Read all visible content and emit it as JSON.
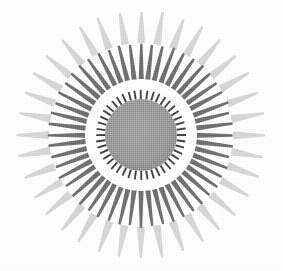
{
  "image": {
    "kind": "sunburst-emblem",
    "description": "Scanned halftone sunburst / starburst rosette",
    "width": 283,
    "height": 271,
    "background_color": "#ffffff"
  },
  "geometry": {
    "center_x": 141,
    "center_y": 135
  },
  "palette": {
    "background": "#ffffff",
    "center_disc": "#9a9a9a",
    "center_disc_edge": "#8d8d8d",
    "inner_tick": "#3f3f3f",
    "mid_ray": "#6e6e6e",
    "mid_ray_shade": "#5d5d5d",
    "outer_ray": "#d6d6d6",
    "outer_ray_shade": "#c4c4c4"
  },
  "layers": {
    "center_disc": {
      "name": "center-disc",
      "radius": 36,
      "fill": "#9a9a9a"
    },
    "inner_ticks": {
      "name": "inner-tick-ring",
      "count": 44,
      "inner_radius": 36,
      "outer_radius": 45,
      "base_width_deg": 3.1,
      "tip_width_deg": 2.3,
      "fill": "#3f3f3f"
    },
    "mid_rays": {
      "name": "mid-ray-ring",
      "count": 52,
      "inner_radius": 56,
      "outer_radius": 92,
      "base_width_deg": 5.2,
      "tip_width_deg": 1.5,
      "fill": "#6e6e6e"
    },
    "outer_rays": {
      "name": "outer-ray-ring",
      "count": 36,
      "inner_radius": 92,
      "outer_radius": 124,
      "base_width_deg": 5.0,
      "tip_width_deg": 1.0,
      "fill": "#d6d6d6"
    }
  }
}
